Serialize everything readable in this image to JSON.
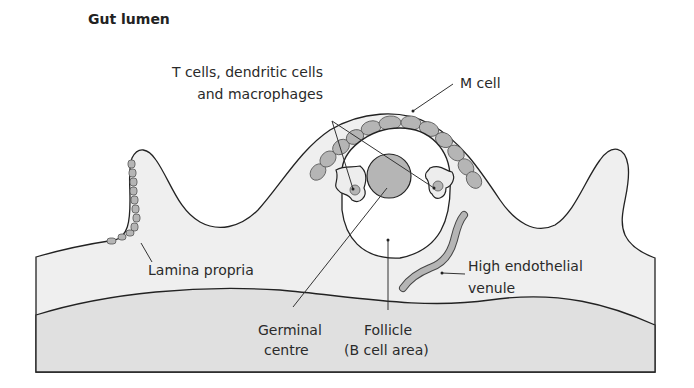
{
  "title": "Gut lumen",
  "labels": {
    "t_cells_line1": "T cells, dendritic cells",
    "t_cells_line2": "and macrophages",
    "m_cell": "M cell",
    "lamina_propria": "Lamina propria",
    "hev_line1": "High endothelial",
    "hev_line2": "venule",
    "germinal_line1": "Germinal",
    "germinal_line2": "centre",
    "follicle_line1": "Follicle",
    "follicle_line2": "(B cell area)"
  },
  "colors": {
    "tissue": "#efefef",
    "submucosa": "#e0e0e0",
    "cells": "#b5b5b5",
    "outline": "#222222"
  }
}
